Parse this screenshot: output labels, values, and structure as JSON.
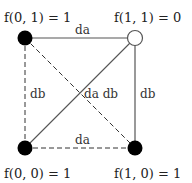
{
  "diagram": {
    "type": "boolean-function-square",
    "nodes": [
      {
        "id": "f01",
        "label": "f(0, 1) = 1",
        "x": 25,
        "y": 38,
        "filled": true,
        "value": 1
      },
      {
        "id": "f11",
        "label": "f(1, 1) = 0",
        "x": 135,
        "y": 38,
        "filled": false,
        "value": 0
      },
      {
        "id": "f00",
        "label": "f(0, 0) = 1",
        "x": 25,
        "y": 148,
        "filled": true,
        "value": 1
      },
      {
        "id": "f10",
        "label": "f(1, 0) = 1",
        "x": 135,
        "y": 148,
        "filled": true,
        "value": 1
      }
    ],
    "edges": [
      {
        "id": "top",
        "from": "f01",
        "to": "f11",
        "style": "solid",
        "label": "da"
      },
      {
        "id": "bottom",
        "from": "f00",
        "to": "f10",
        "style": "dashed",
        "label": "da"
      },
      {
        "id": "left",
        "from": "f01",
        "to": "f00",
        "style": "dashed",
        "label": "db"
      },
      {
        "id": "right",
        "from": "f11",
        "to": "f10",
        "style": "solid",
        "label": "db"
      },
      {
        "id": "diag_up",
        "from": "f00",
        "to": "f11",
        "style": "solid"
      },
      {
        "id": "diag_down",
        "from": "f01",
        "to": "f10",
        "style": "dashed"
      }
    ],
    "center_label": "da db",
    "colors": {
      "filled": "#000000",
      "hollow_fill": "#ffffff",
      "line": "#555555",
      "dashed_line": "#333333"
    }
  }
}
